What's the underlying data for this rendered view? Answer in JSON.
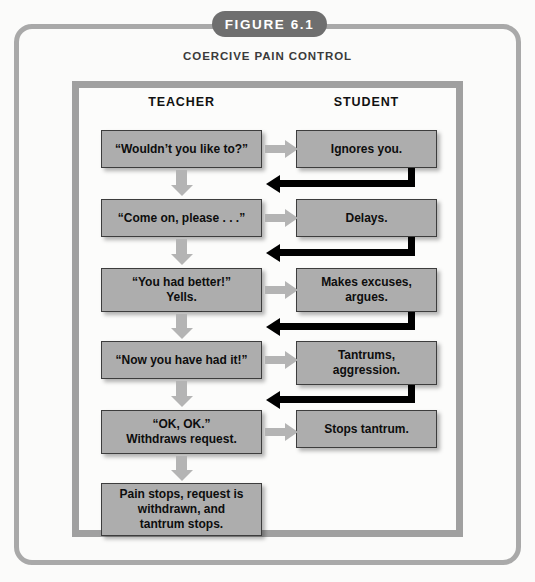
{
  "figure": {
    "label": "FIGURE 6.1",
    "subtitle": "COERCIVE PAIN CONTROL"
  },
  "columns": {
    "teacher_header": "TEACHER",
    "student_header": "STUDENT"
  },
  "colors": {
    "page_background": "#fbfbfa",
    "outer_frame": "#a9a9a9",
    "inner_frame": "#a0a0a0",
    "pill_background": "#6f6f6f",
    "pill_text": "#ffffff",
    "node_fill": "#adadad",
    "node_border": "#3d3d3d",
    "node_text": "#0d0d0d",
    "forward_arrow": "#b4b4b4",
    "return_arrow": "#000000"
  },
  "rows": [
    {
      "teacher": "“Wouldn’t you like to?”",
      "student": "Ignores you."
    },
    {
      "teacher": "“Come on, please . . .”",
      "student": "Delays."
    },
    {
      "teacher": "“You had better!”\nYells.",
      "student": "Makes excuses,\nargues."
    },
    {
      "teacher": "“Now you have had it!”",
      "student": "Tantrums,\naggression."
    },
    {
      "teacher": "“OK, OK.”\nWithdraws request.",
      "student": "Stops tantrum."
    }
  ],
  "outcome": {
    "teacher": "Pain stops, request is\nwithdrawn, and\ntantrum stops."
  }
}
